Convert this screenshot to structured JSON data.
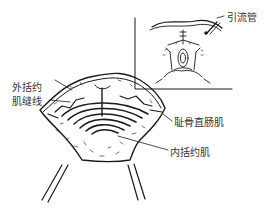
{
  "figure": {
    "stroke_color": "#1a1a1a",
    "background": "#ffffff"
  },
  "labels": {
    "drain_tube": "引流管",
    "external_sphincter_suture_line1": "外括约",
    "external_sphincter_suture_line2": "肌缝线",
    "puborectalis": "耻骨直肠肌",
    "internal_sphincter": "内括约肌"
  }
}
